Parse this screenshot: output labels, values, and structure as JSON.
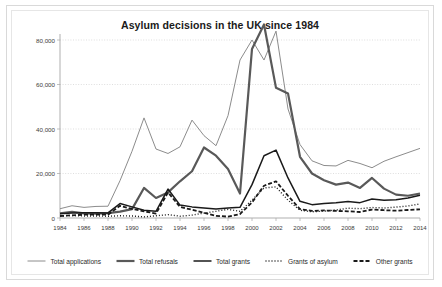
{
  "chart_data": {
    "type": "line",
    "title": "Asylum decisions in the UK since 1984",
    "xlabel": "",
    "ylabel": "",
    "grid": true,
    "legend_position": "bottom",
    "xlim": [
      1984,
      2014
    ],
    "ylim": [
      0,
      80000
    ],
    "y_ticks": [
      0,
      20000,
      40000,
      60000,
      80000
    ],
    "y_tick_labels": [
      "0",
      "20,000",
      "40,000",
      "60,000",
      "80,000"
    ],
    "x_ticks": [
      1984,
      1986,
      1988,
      1990,
      1992,
      1994,
      1996,
      1998,
      2000,
      2002,
      2004,
      2006,
      2008,
      2010,
      2012,
      2014
    ],
    "x_tick_labels": [
      "1984",
      "1986",
      "1988",
      "1990",
      "1992",
      "1994",
      "1996",
      "1998",
      "2000",
      "2002",
      "2004",
      "2006",
      "2008",
      "2010",
      "2012",
      "2014"
    ],
    "x": [
      1984,
      1985,
      1986,
      1987,
      1988,
      1989,
      1990,
      1991,
      1992,
      1993,
      1994,
      1995,
      1996,
      1997,
      1998,
      1999,
      2000,
      2001,
      2002,
      2003,
      2004,
      2005,
      2006,
      2007,
      2008,
      2009,
      2010,
      2011,
      2012,
      2013,
      2014
    ],
    "series": [
      {
        "name": "Total applications",
        "style": "solid-thin",
        "color": "#8c8c8c",
        "width": 1.0,
        "dash": "",
        "values": [
          4170,
          5500,
          4770,
          5200,
          5300,
          16780,
          30000,
          45000,
          31000,
          29000,
          32000,
          44000,
          37000,
          32500,
          46000,
          71000,
          80000,
          71000,
          84000,
          49000,
          33000,
          25700,
          23600,
          23400,
          25900,
          24500,
          22600,
          25500,
          27500,
          29400,
          31300
        ],
        "max_value": 84000,
        "max_year": 2002,
        "end_value": 31300
      },
      {
        "name": "Total refusals",
        "style": "solid-thick",
        "color": "#595959",
        "width": 2.2,
        "dash": "",
        "values": [
          2150,
          2800,
          2100,
          2000,
          2200,
          2850,
          4000,
          13500,
          9000,
          11500,
          16500,
          21000,
          31700,
          28000,
          22000,
          11000,
          76000,
          87000,
          58500,
          56000,
          27500,
          20000,
          17000,
          15000,
          15900,
          13500,
          18000,
          13200,
          10500,
          10000,
          11000
        ],
        "max_value": 87000,
        "max_year": 2001,
        "end_value": 11000
      },
      {
        "name": "Total grants",
        "style": "solid-medium",
        "color": "#1a1a1a",
        "width": 1.5,
        "dash": "",
        "values": [
          1900,
          2300,
          2400,
          2400,
          2300,
          6500,
          5000,
          3500,
          3000,
          13000,
          5800,
          5000,
          4500,
          4000,
          4500,
          4800,
          15000,
          28000,
          30500,
          18000,
          7500,
          6000,
          6500,
          6800,
          7400,
          6900,
          8500,
          8000,
          8200,
          9000,
          10200
        ],
        "max_value": 30500,
        "max_year": 2002,
        "end_value": 10200
      },
      {
        "name": "Grants of asylum",
        "style": "dotted",
        "color": "#1a1a1a",
        "width": 1.4,
        "dash": "1,2",
        "values": [
          1000,
          1100,
          900,
          900,
          800,
          1000,
          900,
          500,
          1000,
          1500,
          800,
          1300,
          2200,
          3000,
          3900,
          3000,
          8000,
          13500,
          14000,
          8000,
          3500,
          2800,
          3100,
          3600,
          4400,
          4200,
          4700,
          4500,
          4900,
          5400,
          6300
        ],
        "max_value": 14000,
        "max_year": 2002,
        "end_value": 6300
      },
      {
        "name": "Other grants",
        "style": "dashed",
        "color": "#1a1a1a",
        "width": 1.8,
        "dash": "4,2",
        "values": [
          900,
          1200,
          1500,
          1500,
          1500,
          5500,
          4100,
          3000,
          2000,
          11500,
          5000,
          3700,
          2300,
          1000,
          600,
          1800,
          7000,
          14500,
          16500,
          10000,
          4000,
          3200,
          3400,
          3200,
          3000,
          2700,
          3800,
          3500,
          3300,
          3600,
          3900
        ],
        "max_value": 16500,
        "max_year": 2002,
        "end_value": 3900
      }
    ]
  },
  "legend": {
    "items": [
      {
        "label": "Total applications",
        "swatch": "line-thin-gray"
      },
      {
        "label": "Total refusals",
        "swatch": "line-thick-gray"
      },
      {
        "label": "Total grants",
        "swatch": "line-medium-black"
      },
      {
        "label": "Grants of asylum",
        "swatch": "line-dotted-black"
      },
      {
        "label": "Other grants",
        "swatch": "line-dashed-black"
      }
    ]
  }
}
